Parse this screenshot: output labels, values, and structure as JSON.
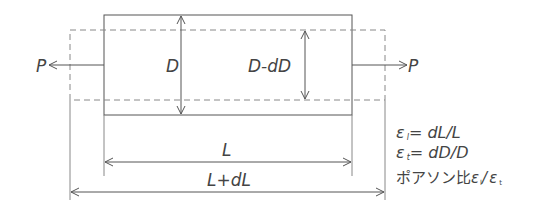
{
  "diagram": {
    "colors": {
      "line": "#555555",
      "dashed": "#777777",
      "text": "#444444",
      "background": "#ffffff"
    },
    "labels": {
      "force_left": "P",
      "force_right": "P",
      "original_diameter": "D",
      "new_diameter": "D-dD",
      "original_length": "L",
      "new_length": "L+dL"
    },
    "formulas": {
      "longitudinal_strain": {
        "symbol": "ε",
        "sub": "l",
        "expr": "= dL/L"
      },
      "transverse_strain": {
        "symbol": "ε",
        "sub": "t",
        "expr": "= dD/D"
      },
      "poisson_ratio": {
        "prefix": "ポアソン比",
        "num": "ε",
        "num_sub": "l",
        "slash": "/",
        "den": "ε",
        "den_sub": "t"
      }
    }
  }
}
